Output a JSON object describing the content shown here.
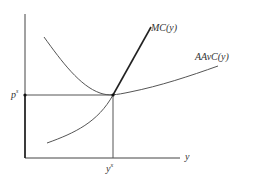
{
  "diagram": {
    "type": "economics cost curves",
    "axes": {
      "x_label": "y",
      "y_label": ""
    },
    "curves": [
      {
        "id": "mc",
        "label": "MC(y)"
      },
      {
        "id": "aavc",
        "label": "AAvC(y)"
      }
    ],
    "equilibrium": {
      "price_label": "p",
      "price_label_sup": "s",
      "quantity_label": "y",
      "quantity_label_sup": "x"
    },
    "colors": {
      "axis": "#333333",
      "curve": "#555555",
      "mc_supply_segment": "#222222",
      "background": "#ffffff"
    }
  }
}
